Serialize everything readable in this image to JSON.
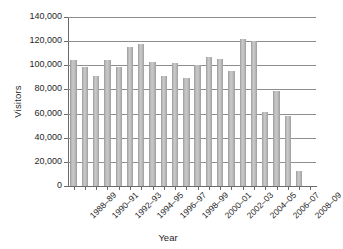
{
  "chart_data": {
    "type": "bar",
    "title": "",
    "xlabel": "Year",
    "ylabel": "Visitors",
    "ylim": [
      0,
      140000
    ],
    "ytick_values": [
      0,
      20000,
      40000,
      60000,
      80000,
      100000,
      120000,
      140000
    ],
    "ytick_labels": [
      "0",
      "20,000",
      "40,000",
      "60,000",
      "80,000",
      "100,000",
      "120,000",
      "140,000"
    ],
    "grid": true,
    "legend": "none",
    "bar_color": "#b4b4b4",
    "categories": [
      "1988–89",
      "1989–90",
      "1990–91",
      "1991–92",
      "1992–93",
      "1993–94",
      "1994–95",
      "1995–96",
      "1996–97",
      "1997–98",
      "1998–99",
      "1999–2000",
      "2000–01",
      "2001–02",
      "2002–03",
      "2003–04",
      "2004–05",
      "2005–06",
      "2006–07",
      "2007–08",
      "2008–09",
      "2009–10"
    ],
    "visible_xtick_labels": [
      "1988–89",
      "1990–91",
      "1992–93",
      "1994–95",
      "1996–97",
      "1998–99",
      "2000–01",
      "2002–03",
      "2004–05",
      "2006–07",
      "2008–09"
    ],
    "values": [
      104000,
      99000,
      91500,
      104500,
      99000,
      115500,
      118000,
      102500,
      91000,
      102000,
      89500,
      100500,
      107000,
      105000,
      95500,
      121500,
      120000,
      61500,
      78500,
      58000,
      12500,
      0
    ]
  }
}
